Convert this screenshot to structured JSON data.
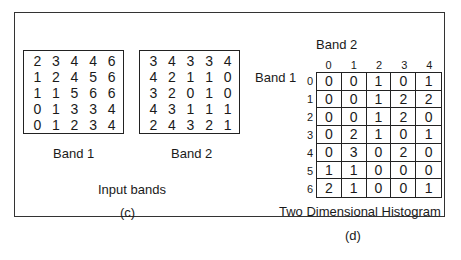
{
  "left_panel": {
    "band1": {
      "label": "Band 1",
      "values": [
        [
          2,
          3,
          4,
          4,
          6
        ],
        [
          1,
          2,
          4,
          5,
          6
        ],
        [
          1,
          1,
          5,
          6,
          6
        ],
        [
          0,
          1,
          3,
          3,
          4
        ],
        [
          0,
          1,
          2,
          3,
          4
        ]
      ]
    },
    "band2": {
      "label": "Band 2",
      "values": [
        [
          3,
          4,
          3,
          3,
          4
        ],
        [
          4,
          2,
          1,
          1,
          0
        ],
        [
          3,
          2,
          0,
          1,
          0
        ],
        [
          4,
          3,
          1,
          1,
          1
        ],
        [
          2,
          4,
          3,
          2,
          1
        ]
      ]
    },
    "caption": "Input bands",
    "sublabel": "(c)"
  },
  "right_panel": {
    "col_axis_label": "Band 2",
    "row_axis_label": "Band 1",
    "col_headers": [
      "0",
      "1",
      "2",
      "3",
      "4"
    ],
    "row_headers": [
      "0",
      "1",
      "2",
      "3",
      "4",
      "5",
      "6"
    ],
    "values": [
      [
        0,
        0,
        1,
        0,
        1
      ],
      [
        0,
        0,
        1,
        2,
        2
      ],
      [
        0,
        0,
        1,
        2,
        0
      ],
      [
        0,
        2,
        1,
        0,
        1
      ],
      [
        0,
        3,
        0,
        2,
        0
      ],
      [
        1,
        1,
        0,
        0,
        0
      ],
      [
        2,
        1,
        0,
        0,
        1
      ]
    ],
    "caption": "Two Dimensional Histogram",
    "sublabel": "(d)"
  }
}
